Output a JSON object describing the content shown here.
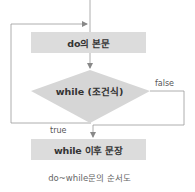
{
  "diagram": {
    "type": "flowchart",
    "nodes": {
      "body": {
        "label": "do의 본문"
      },
      "condition": {
        "label": "while (조건식)"
      },
      "after": {
        "label": "while 이후 문장"
      }
    },
    "edges": {
      "true_label": "true",
      "false_label": "false"
    },
    "caption": "do~while문의 순서도",
    "colors": {
      "box_fill": "#dcdcdc",
      "line": "#9a9a9a",
      "text": "#333333"
    }
  }
}
